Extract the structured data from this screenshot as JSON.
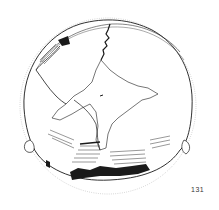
{
  "figure": {
    "view": "superior view of cranium, line drawing",
    "number": "131",
    "colors": {
      "ink": "#1a1a1a",
      "background": "#ffffff",
      "outline": "#999999"
    }
  }
}
